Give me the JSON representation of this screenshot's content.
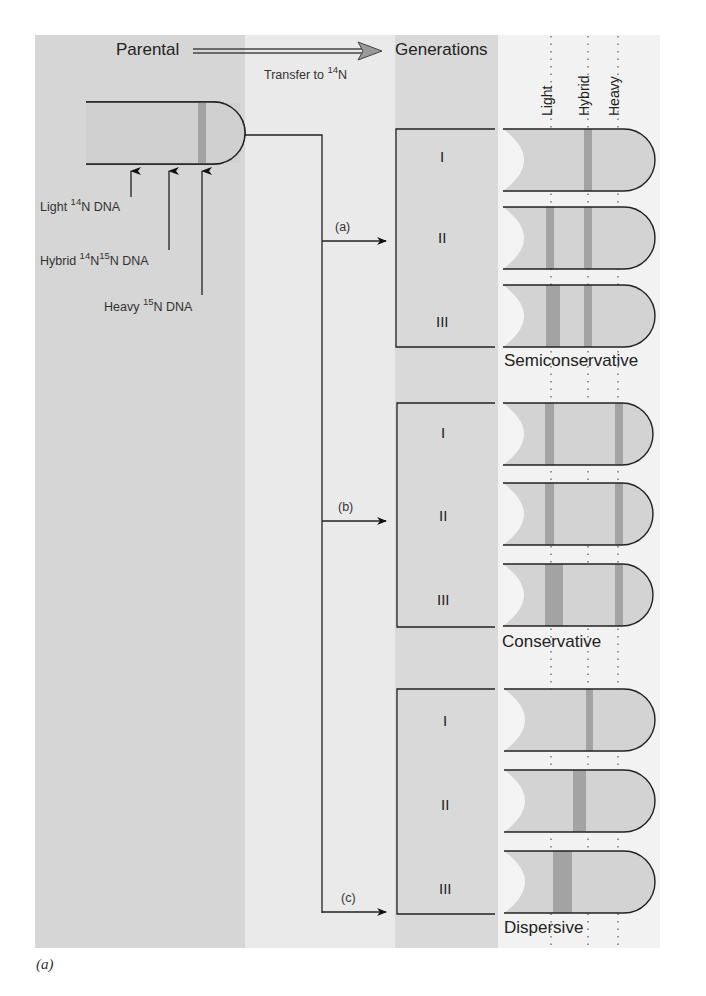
{
  "header": {
    "parental": "Parental",
    "generations": "Generations",
    "transfer_prefix": "Transfer to ",
    "transfer_sup": "14",
    "transfer_suffix": "N"
  },
  "columns": {
    "light": "Light",
    "hybrid": "Hybrid",
    "heavy": "Heavy"
  },
  "parental_labels": {
    "light": {
      "name": "Light ",
      "sup1": "14",
      "rest": "N DNA"
    },
    "hybrid": {
      "name": "Hybrid ",
      "sup1": "14",
      "mid": "N",
      "sup2": "15",
      "rest": "N DNA"
    },
    "heavy": {
      "name": "Heavy ",
      "sup1": "15",
      "rest": "N DNA"
    }
  },
  "models": [
    {
      "branch": "(a)",
      "name": "Semiconservative",
      "generations": [
        "I",
        "II",
        "III"
      ],
      "bands": [
        [
          "hybrid"
        ],
        [
          "light",
          "hybrid"
        ],
        [
          "light-wide",
          "hybrid"
        ]
      ]
    },
    {
      "branch": "(b)",
      "name": "Conservative",
      "generations": [
        "I",
        "II",
        "III"
      ],
      "bands": [
        [
          "light",
          "heavy"
        ],
        [
          "light",
          "heavy"
        ],
        [
          "light-wide",
          "heavy"
        ]
      ]
    },
    {
      "branch": "(c)",
      "name": "Dispersive",
      "generations": [
        "I",
        "II",
        "III"
      ],
      "bands": [
        [
          "hybrid"
        ],
        [
          "between-light-hybrid"
        ],
        [
          "near-light-wide"
        ]
      ]
    }
  ],
  "caption": "(a)",
  "colors": {
    "parental_bg": "#d6d6d6",
    "transfer_bg": "#eaeaea",
    "generations_bg": "#d9d9d9",
    "tube_fill": "#d3d3d3",
    "band": "#a3a3a3",
    "outline": "#333333"
  }
}
